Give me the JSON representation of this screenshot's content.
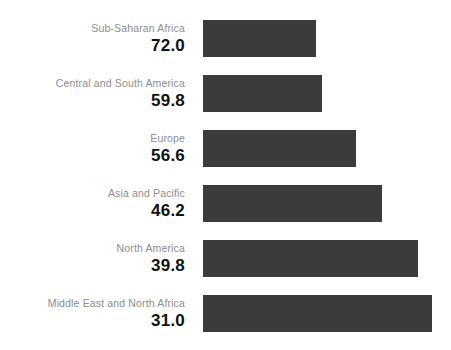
{
  "chart_data": {
    "type": "bar",
    "orientation": "horizontal",
    "title": "",
    "subtitle": "",
    "xlabel": "",
    "ylabel": "",
    "grid": false,
    "legend": false,
    "axis_visible": false,
    "tick_labels": [],
    "value_label_position": "left-of-bar",
    "bar_color": "#3b3b3b",
    "background_color": "#ffffff",
    "label_color": "#8d8d8d",
    "value_color": "#111111",
    "note": "Bar pixel length is inversely related to the printed value: the smallest value has the longest bar.",
    "categories": [
      "Sub-Saharan Africa",
      "Central and South America",
      "Europe",
      "Asia and Pacific",
      "North America",
      "Middle East and North Africa"
    ],
    "values": [
      72.0,
      59.8,
      56.6,
      46.2,
      39.8,
      31.0
    ],
    "value_labels": [
      "72.0",
      "59.8",
      "56.6",
      "46.2",
      "39.8",
      "31.0"
    ],
    "bar_pixel_widths": [
      113,
      119,
      153,
      179,
      215,
      229
    ],
    "xlim": [
      0,
      80
    ],
    "ylim": [
      0,
      0
    ]
  },
  "rows": [
    {
      "label": "Sub-Saharan Africa",
      "value": "72.0",
      "bar_width_px": 113,
      "top_px": 20
    },
    {
      "label": "Central and South America",
      "value": "59.8",
      "bar_width_px": 119,
      "top_px": 75
    },
    {
      "label": "Europe",
      "value": "56.6",
      "bar_width_px": 153,
      "top_px": 130
    },
    {
      "label": "Asia and Pacific",
      "value": "46.2",
      "bar_width_px": 179,
      "top_px": 185
    },
    {
      "label": "North America",
      "value": "39.8",
      "bar_width_px": 215,
      "top_px": 240
    },
    {
      "label": "Middle East and North Africa",
      "value": "31.0",
      "bar_width_px": 229,
      "top_px": 295
    }
  ]
}
